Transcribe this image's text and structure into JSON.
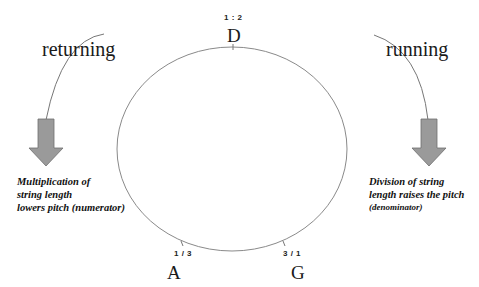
{
  "diagram": {
    "type": "circle-of-ratios",
    "colors": {
      "line": "#808080",
      "arrow_fill": "#9a9a9a",
      "arrow_stroke": "#6f6f6f",
      "text": "#111111"
    },
    "labels": {
      "left_direction": "returning",
      "right_direction": "running"
    },
    "nodes": [
      {
        "note": "D",
        "ratio": "1 : 2",
        "position": "top"
      },
      {
        "note": "A",
        "ratio": "1 / 3",
        "position": "bottom-left"
      },
      {
        "note": "G",
        "ratio": "3 / 1",
        "position": "bottom-right"
      }
    ],
    "captions": {
      "left": {
        "lines": [
          "Multiplication of",
          "string length",
          "lowers pitch (numerator)"
        ]
      },
      "right": {
        "lines": [
          "Division of string",
          "length raises the pitch",
          "(denominator)"
        ]
      }
    },
    "arrows": [
      {
        "side": "left",
        "direction": "down"
      },
      {
        "side": "right",
        "direction": "down"
      }
    ]
  }
}
